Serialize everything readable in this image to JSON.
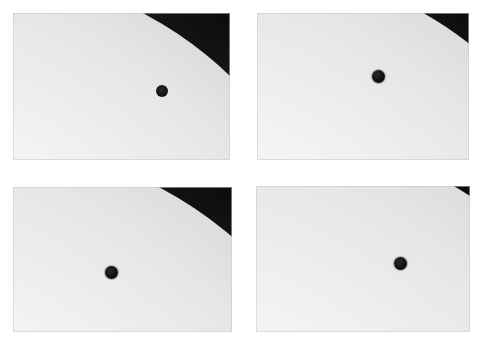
{
  "figure": {
    "title": "Transit of Venus sequence",
    "description": "Four photographic frames of the solar limb showing Venus as a small black disc moving onto the face of the Sun",
    "background_color": "#ffffff",
    "width": 482,
    "height": 344,
    "columns": 2,
    "rows": 2
  },
  "colors": {
    "sky": "#141414",
    "sky_deep": "#0a0a0a",
    "solar_disc": "#f2f2f2",
    "solar_core": "#ffffff",
    "limb_darkening": "#bdbdbd",
    "venus": "#0b0b0b",
    "page_background": "#ffffff",
    "frame_edge": "#c8c8c8"
  },
  "panels": [
    {
      "id": "panel-1",
      "label": "a",
      "caption": "Venus at ingress — notch on the solar limb",
      "frame": {
        "x": 13,
        "y": 13,
        "w": 217,
        "h": 147
      },
      "sun": {
        "cx": -42,
        "cy": 330,
        "r": 372
      },
      "venus": {
        "cx": 149,
        "cy": 78,
        "r": 6,
        "on_limb": true,
        "visible": true
      }
    },
    {
      "id": "panel-2",
      "label": "b",
      "caption": "Venus fully onto the disc, near the limb",
      "frame": {
        "x": 257,
        "y": 13,
        "w": 212,
        "h": 147
      },
      "sun": {
        "cx": -22,
        "cy": 330,
        "r": 380
      },
      "venus": {
        "cx": 121,
        "cy": 63,
        "r": 6.5,
        "on_limb": false,
        "visible": true
      }
    },
    {
      "id": "panel-3",
      "label": "c",
      "caption": "Venus advanced further inside the solar disc",
      "frame": {
        "x": 13,
        "y": 187,
        "w": 219,
        "h": 145
      },
      "sun": {
        "cx": -40,
        "cy": 352,
        "r": 398
      },
      "venus": {
        "cx": 98,
        "cy": 85,
        "r": 6.5,
        "on_limb": false,
        "visible": true
      }
    },
    {
      "id": "panel-4",
      "label": "d",
      "caption": "Venus well within the solar disc",
      "frame": {
        "x": 256,
        "y": 186,
        "w": 214,
        "h": 146
      },
      "sun": {
        "cx": -18,
        "cy": 372,
        "r": 430
      },
      "venus": {
        "cx": 144,
        "cy": 77,
        "r": 6.5,
        "on_limb": false,
        "visible": true
      }
    }
  ]
}
